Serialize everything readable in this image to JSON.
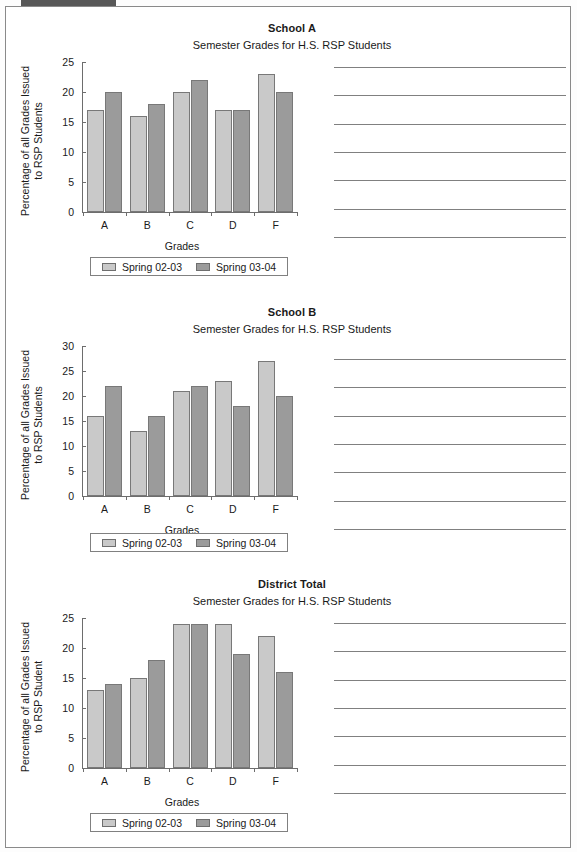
{
  "page": {
    "tab_marker": "dark-tab-marker",
    "background_color": "#ffffff",
    "border_color": "#8a8a8a"
  },
  "legend": {
    "series": [
      {
        "label": "Spring 02-03",
        "color": "#c9c9c9"
      },
      {
        "label": "Spring 03-04",
        "color": "#9b9b9b"
      }
    ]
  },
  "notes": {
    "line_count_per_section": 7,
    "line_color": "#808080"
  },
  "chart_data": [
    {
      "type": "bar",
      "title": "School A",
      "subtitle": "Semester Grades for H.S. RSP Students",
      "xlabel": "Grades",
      "ylabel_line1": "Percentage of all Grades Issued",
      "ylabel_line2": "to RSP Students",
      "categories": [
        "A",
        "B",
        "C",
        "D",
        "F"
      ],
      "yticks": [
        0,
        5,
        10,
        15,
        20,
        25
      ],
      "ylim": [
        0,
        25
      ],
      "grid": false,
      "legend_position": "below",
      "series": [
        {
          "name": "Spring 02-03",
          "color": "#c9c9c9",
          "values": [
            17,
            16,
            20,
            17,
            23
          ]
        },
        {
          "name": "Spring 03-04",
          "color": "#9b9b9b",
          "values": [
            20,
            18,
            22,
            17,
            20
          ]
        }
      ]
    },
    {
      "type": "bar",
      "title": "School B",
      "subtitle": "Semester Grades for H.S. RSP Students",
      "xlabel": "Grades",
      "ylabel_line1": "Percentage of all Grades Issued",
      "ylabel_line2": "to RSP Students",
      "categories": [
        "A",
        "B",
        "C",
        "D",
        "F"
      ],
      "yticks": [
        0,
        5,
        10,
        15,
        20,
        25,
        30
      ],
      "ylim": [
        0,
        30
      ],
      "grid": false,
      "legend_position": "below",
      "series": [
        {
          "name": "Spring 02-03",
          "color": "#c9c9c9",
          "values": [
            16,
            13,
            21,
            23,
            27
          ]
        },
        {
          "name": "Spring 03-04",
          "color": "#9b9b9b",
          "values": [
            22,
            16,
            22,
            18,
            20
          ]
        }
      ]
    },
    {
      "type": "bar",
      "title": "District Total",
      "subtitle": "Semester Grades for H.S. RSP Students",
      "xlabel": "Grades",
      "ylabel_line1": "Percentage of all Grades Issued",
      "ylabel_line2": "to RSP Student",
      "categories": [
        "A",
        "B",
        "C",
        "D",
        "F"
      ],
      "yticks": [
        0,
        5,
        10,
        15,
        20,
        25
      ],
      "ylim": [
        0,
        25
      ],
      "grid": false,
      "legend_position": "below",
      "series": [
        {
          "name": "Spring 02-03",
          "color": "#c9c9c9",
          "values": [
            13,
            15,
            24,
            24,
            22
          ]
        },
        {
          "name": "Spring 03-04",
          "color": "#9b9b9b",
          "values": [
            14,
            18,
            24,
            19,
            16
          ]
        }
      ]
    }
  ]
}
